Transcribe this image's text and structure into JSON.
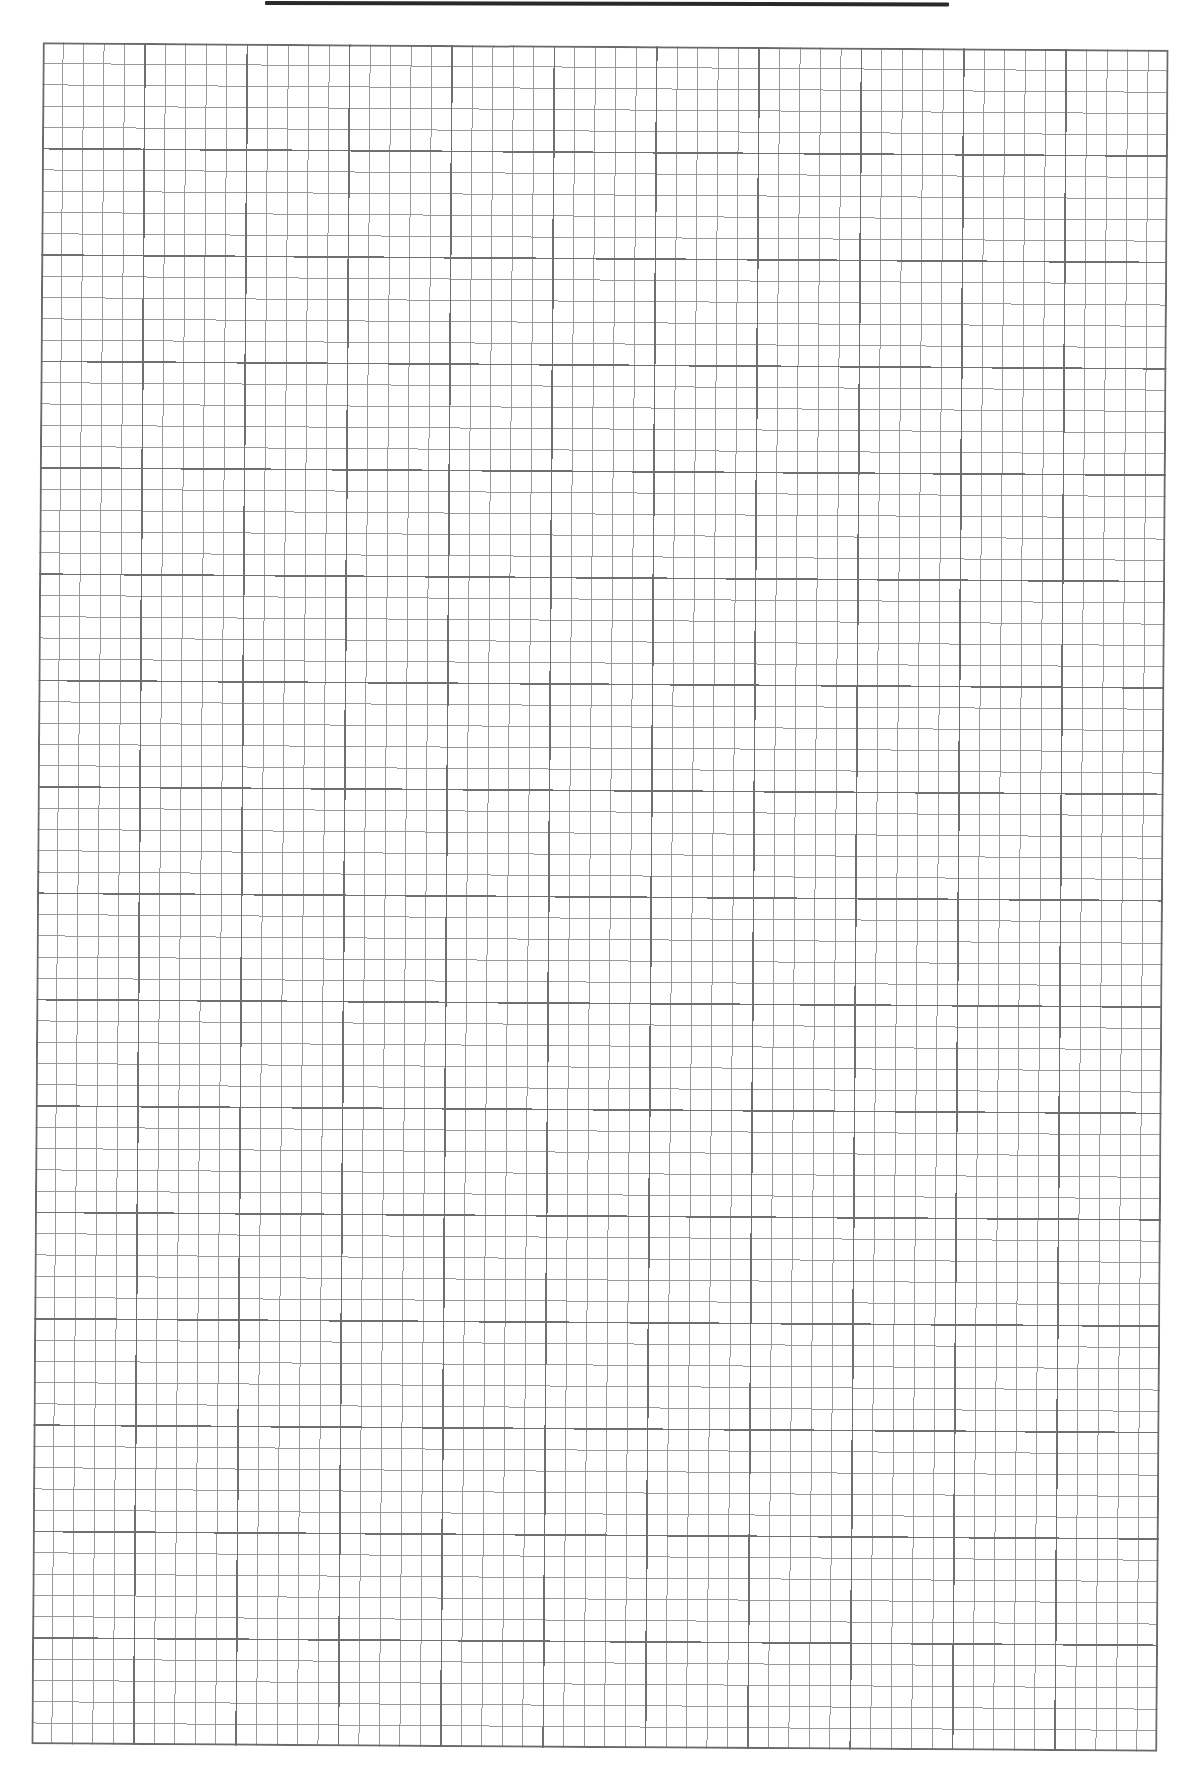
{
  "page": {
    "type": "graph-paper",
    "content": "blank"
  },
  "header_rule": {
    "color": "#2a2a2a"
  },
  "grid": {
    "columns": 55,
    "rows": 80,
    "major_every": 5,
    "minor_line_color": "#9a9a9a",
    "major_line_color": "#6f6f6f",
    "border_color": "#6a6a6a"
  }
}
